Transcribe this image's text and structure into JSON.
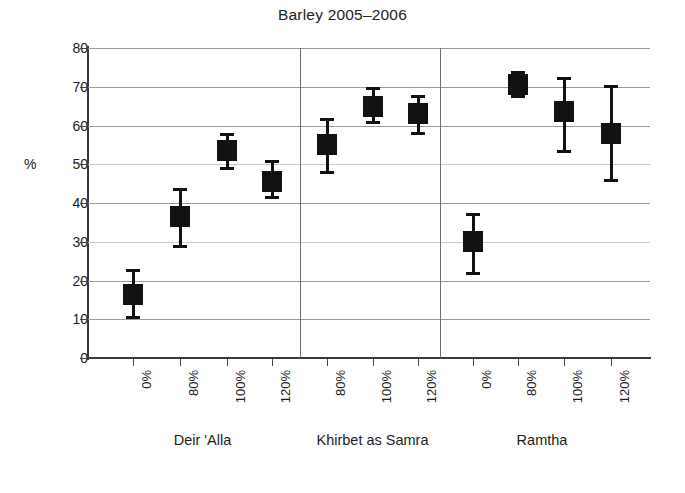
{
  "chart_data": {
    "type": "scatter",
    "title": "Barley 2005–2006",
    "xlabel": "",
    "ylabel": "%",
    "ylim": [
      0,
      80
    ],
    "yticks": [
      0,
      10,
      20,
      30,
      40,
      50,
      60,
      70,
      80
    ],
    "grid": true,
    "legend": "none",
    "marker_style": "filled-square-with-error-bars",
    "marker_color": "#111111",
    "groups": [
      {
        "name": "Deir 'Alla",
        "categories": [
          "0%",
          "80%",
          "100%",
          "120%"
        ],
        "values": [
          16.5,
          36.5,
          53.5,
          45.5
        ],
        "err_low": [
          10.0,
          28.5,
          48.5,
          41.0
        ],
        "err_high": [
          23.0,
          44.0,
          58.0,
          51.0
        ]
      },
      {
        "name": "Khirbet as Samra",
        "categories": [
          "80%",
          "100%",
          "120%"
        ],
        "values": [
          55.0,
          65.0,
          63.0
        ],
        "err_low": [
          47.5,
          60.5,
          57.5
        ],
        "err_high": [
          62.0,
          70.0,
          68.0
        ]
      },
      {
        "name": "Ramtha",
        "categories": [
          "0%",
          "80%",
          "100%",
          "120%"
        ],
        "values": [
          30.0,
          70.5,
          63.5,
          58.0
        ],
        "err_low": [
          21.5,
          67.0,
          53.0,
          45.5
        ],
        "err_high": [
          37.5,
          74.0,
          72.5,
          70.5
        ]
      }
    ]
  },
  "axis": {
    "y_unit_label": "%",
    "y_tick_labels": [
      "0",
      "10",
      "20",
      "30",
      "40",
      "50",
      "60",
      "70",
      "80"
    ]
  },
  "colors": {
    "marker": "#111111",
    "grid": "#9a9a9a",
    "grid_faint": "#c9c9c9",
    "axis": "#3a3a3a",
    "separator": "#6f6f6f",
    "text": "#1d1d1d",
    "background": "#ffffff"
  }
}
